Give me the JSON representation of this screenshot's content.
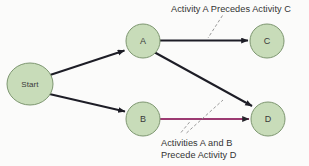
{
  "diagram": {
    "background_color": "#fbfbfa",
    "node_fill_color": "#c8dcb9",
    "node_stroke_color": "#7d9670",
    "arrow_color_default": "#1d1d26",
    "arrow_color_highlight": "#9c3a72",
    "leader_line_color": "#8d8d8d",
    "nodes": [
      {
        "id": "start",
        "label": "Start",
        "cx": 30,
        "cy": 84,
        "rx": 23,
        "ry": 21
      },
      {
        "id": "a",
        "label": "A",
        "cx": 143,
        "cy": 41,
        "rx": 17,
        "ry": 17
      },
      {
        "id": "c",
        "label": "C",
        "cx": 267,
        "cy": 41,
        "rx": 17,
        "ry": 17
      },
      {
        "id": "b",
        "label": "B",
        "cx": 143,
        "cy": 119,
        "rx": 17,
        "ry": 17
      },
      {
        "id": "d",
        "label": "D",
        "cx": 268,
        "cy": 119,
        "rx": 17,
        "ry": 17
      }
    ],
    "edges": [
      {
        "id": "start-a",
        "from": "Start",
        "to": "A",
        "color": "#1d1d26",
        "width": 1.9
      },
      {
        "id": "start-b",
        "from": "Start",
        "to": "B",
        "color": "#1d1d26",
        "width": 1.9
      },
      {
        "id": "a-c",
        "from": "A",
        "to": "C",
        "color": "#1d1d26",
        "width": 1.9
      },
      {
        "id": "a-d",
        "from": "A",
        "to": "D",
        "color": "#1d1d26",
        "width": 2.0
      },
      {
        "id": "b-d",
        "from": "B",
        "to": "D",
        "color": "#9c3a72",
        "width": 2.0
      }
    ],
    "annotations": [
      {
        "id": "ann-ac",
        "lines": [
          "Activity A Precedes Activity C"
        ],
        "x": 171,
        "y": 12,
        "targets_edge": "a-c"
      },
      {
        "id": "ann-abd",
        "lines": [
          "Activities A and B",
          "Precede Activity D"
        ],
        "x": 161,
        "y": 146,
        "targets_edges": [
          "a-d",
          "b-d"
        ]
      }
    ]
  }
}
